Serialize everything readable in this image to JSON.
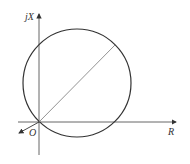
{
  "diagram": {
    "axes": {
      "vertical_label": "jX",
      "horizontal_label": "R",
      "origin_label": "O"
    },
    "colors": {
      "stroke": "#333333",
      "diameter": "#666666",
      "background": "#ffffff"
    },
    "shapes": {
      "circle": {
        "cx": 77,
        "cy": 83,
        "r": 54
      },
      "diameter_line": {
        "x1": 39,
        "y1": 122,
        "x2": 115,
        "y2": 45
      },
      "origin_arrow": {
        "x1": 39,
        "y1": 122,
        "x2": 18,
        "y2": 133
      }
    }
  }
}
